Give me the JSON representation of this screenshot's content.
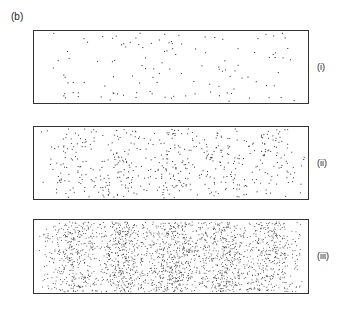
{
  "figure": {
    "panel_letter": "(b)",
    "caption_subject": "double-slit interference build-up",
    "background_color": "#ffffff",
    "border_color": "#333333",
    "dot_color": "#2a2a2a"
  },
  "panels": [
    {
      "tag": "(i)",
      "name": "panel-sparse",
      "dot_count": 120,
      "description": "sparse scatter, individual hits barely hint at fringes"
    },
    {
      "tag": "(ii)",
      "name": "panel-medium",
      "dot_count": 520,
      "description": "moderate density, five vertical fringes clearly emerging"
    },
    {
      "tag": "(iii)",
      "name": "panel-dense",
      "dot_count": 2100,
      "description": "high density, five fringes sharply defined with brightest central band"
    }
  ],
  "chart_data": {
    "type": "scatter",
    "title": "",
    "xlabel": "",
    "ylabel": "",
    "xlim": [
      0,
      1
    ],
    "ylim": [
      0,
      1
    ],
    "grid": false,
    "legend": false,
    "fringe_centers_fraction": [
      0.145,
      0.325,
      0.505,
      0.685,
      0.865
    ],
    "fringe_half_width_fraction": 0.055,
    "fringe_relative_intensity": [
      0.62,
      0.82,
      1.0,
      0.82,
      0.62
    ],
    "series": [
      {
        "name": "(i)",
        "panel_index": 0,
        "values": [
          120
        ],
        "points_per_fringe": [
          21,
          25,
          28,
          24,
          22
        ]
      },
      {
        "name": "(ii)",
        "panel_index": 1,
        "values": [
          520
        ],
        "points_per_fringe": [
          96,
          108,
          116,
          106,
          94
        ]
      },
      {
        "name": "(iii)",
        "panel_index": 2,
        "values": [
          2100
        ],
        "points_per_fringe": [
          372,
          438,
          498,
          430,
          362
        ]
      }
    ]
  }
}
